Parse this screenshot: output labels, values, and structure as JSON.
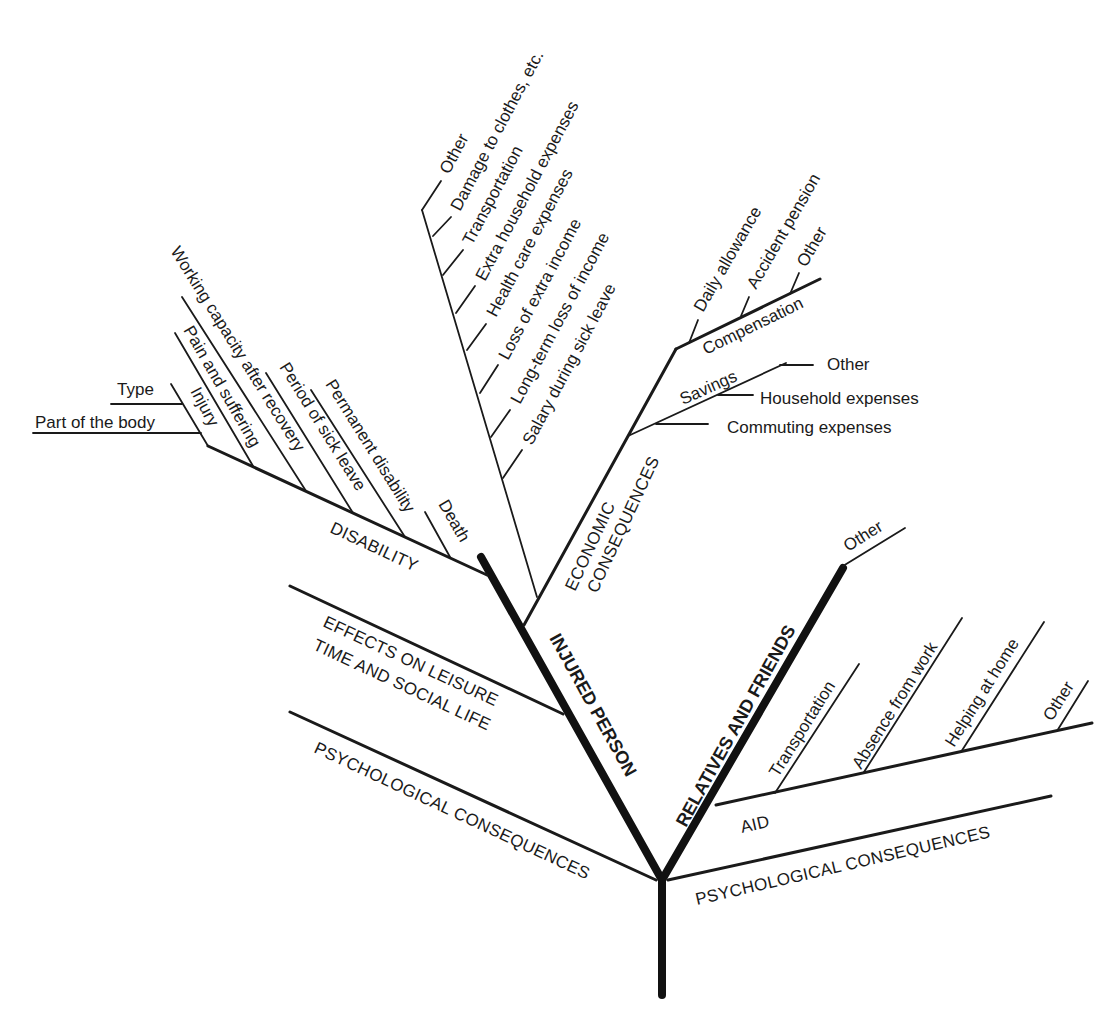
{
  "diagram": {
    "trunk": "",
    "main_branches": {
      "injured_person": "INJURED PERSON",
      "relatives_and_friends": "RELATIVES AND FRIENDS"
    },
    "injured_person": {
      "disability": {
        "label": "DISABILITY",
        "items": [
          "Injury",
          "Pain and suffering",
          "Working capacity after recovery",
          "Period of sick leave",
          "Permanent disability",
          "Death"
        ],
        "injury_sub": [
          "Type",
          "Part of the body"
        ]
      },
      "economic": {
        "label_line1": "ECONOMIC",
        "label_line2": "CONSEQUENCES",
        "costs": [
          "Other",
          "Damage to clothes, etc.",
          "Transportation",
          "Extra household expenses",
          "Health care expenses",
          "Loss of extra income",
          "Long-term loss of income",
          "Salary during sick leave"
        ],
        "compensation": {
          "label": "Compensation",
          "items": [
            "Daily allowance",
            "Accident pension",
            "Other"
          ]
        },
        "savings": {
          "label": "Savings",
          "items": [
            "Other",
            "Household expenses",
            "Commuting expenses"
          ]
        }
      },
      "leisure": {
        "label_line1": "EFFECTS ON LEISURE",
        "label_line2": "TIME AND SOCIAL LIFE"
      },
      "psychological": "PSYCHOLOGICAL CONSEQUENCES"
    },
    "relatives": {
      "other": "Other",
      "aid": {
        "label": "AID",
        "items": [
          "Transportation",
          "Absence from work",
          "Helping at home",
          "Other"
        ]
      },
      "psychological": "PSYCHOLOGICAL CONSEQUENCES"
    },
    "colors": {
      "line": "#1a1a1a",
      "background": "#ffffff"
    }
  }
}
